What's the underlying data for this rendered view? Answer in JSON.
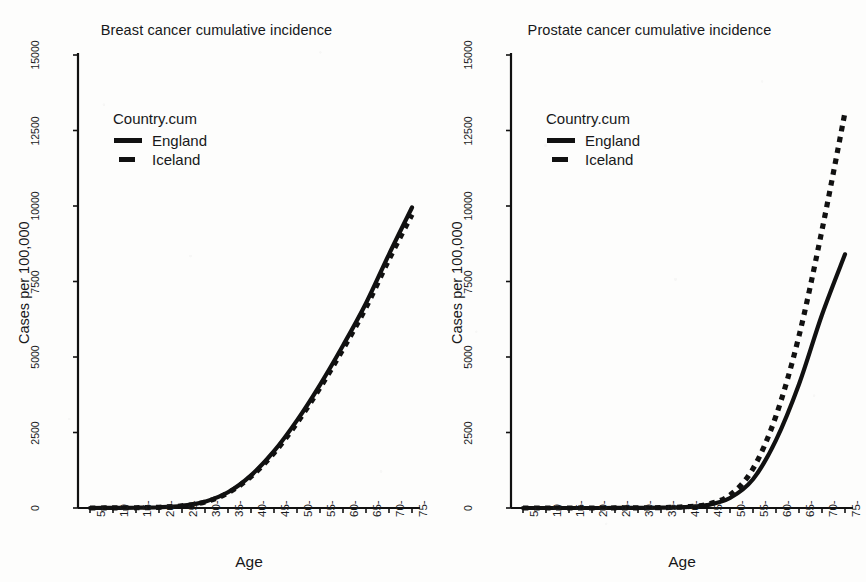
{
  "figure": {
    "background_color": "#fdfdfc",
    "ink_color": "#111111"
  },
  "chart_data": [
    {
      "type": "line",
      "panel": "left",
      "title": "Breast cancer cumulative incidence",
      "xlabel": "Age",
      "ylabel": "Cases per 100,000",
      "xtick_labels": [
        "5-",
        "10",
        "15-",
        "20-",
        "25-",
        "30-",
        "35-",
        "40-",
        "45-",
        "50-",
        "55-",
        "60-",
        "65-",
        "70-",
        "75-"
      ],
      "x": [
        5,
        10,
        15,
        20,
        25,
        30,
        35,
        40,
        45,
        50,
        55,
        60,
        65,
        70,
        75
      ],
      "ytick_labels": [
        "0",
        "2500",
        "5000",
        "7500",
        "10000",
        "12500",
        "15000"
      ],
      "ytick_values": [
        0,
        2500,
        5000,
        7500,
        10000,
        12500,
        15000
      ],
      "ylim": [
        0,
        15000
      ],
      "grid": false,
      "legend_title": "Country.cum",
      "legend_position": "upper-left-inside",
      "series": [
        {
          "name": "England",
          "style": "solid",
          "values": [
            0,
            2,
            8,
            25,
            75,
            210,
            520,
            1080,
            1880,
            2900,
            4080,
            5380,
            6780,
            8400,
            9950
          ]
        },
        {
          "name": "Iceland",
          "style": "dashed",
          "values": [
            0,
            2,
            8,
            24,
            72,
            200,
            500,
            1040,
            1820,
            2820,
            3980,
            5260,
            6640,
            8230,
            9720
          ]
        }
      ]
    },
    {
      "type": "line",
      "panel": "right",
      "title": "Prostate cancer cumulative incidence",
      "xlabel": "Age",
      "ylabel": "Cases per 100,000",
      "xtick_labels": [
        "5-",
        "10",
        "15-",
        "20-",
        "25-",
        "30-",
        "35-",
        "40-",
        "45-",
        "50-",
        "55-",
        "60-",
        "65-",
        "70-",
        "75-"
      ],
      "x": [
        5,
        10,
        15,
        20,
        25,
        30,
        35,
        40,
        45,
        50,
        55,
        60,
        65,
        70,
        75
      ],
      "ytick_labels": [
        "0",
        "2500",
        "5000",
        "7500",
        "10000",
        "12500",
        "15000"
      ],
      "ytick_values": [
        0,
        2500,
        5000,
        7500,
        10000,
        12500,
        15000
      ],
      "ylim": [
        0,
        15000
      ],
      "grid": false,
      "legend_title": "Country.cum",
      "legend_position": "upper-left-inside",
      "series": [
        {
          "name": "England",
          "style": "solid",
          "values": [
            0,
            0,
            0,
            0,
            1,
            3,
            10,
            30,
            95,
            330,
            950,
            2250,
            4100,
            6400,
            8400
          ]
        },
        {
          "name": "Iceland",
          "style": "dashed",
          "values": [
            0,
            0,
            0,
            0,
            1,
            4,
            12,
            38,
            120,
            430,
            1300,
            3050,
            5700,
            9200,
            13100
          ]
        }
      ]
    }
  ]
}
